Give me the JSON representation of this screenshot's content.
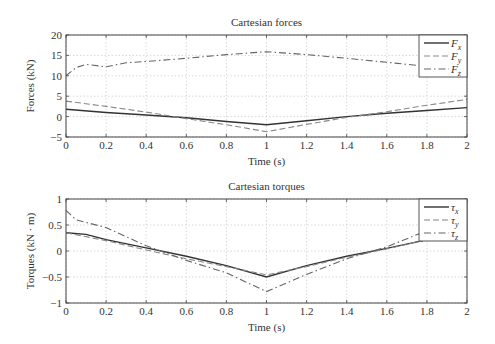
{
  "chart_data": [
    {
      "type": "line",
      "title": "Cartesian forces",
      "xlabel": "Time (s)",
      "ylabel": "Forces (kN)",
      "xlim": [
        0,
        2
      ],
      "ylim": [
        -5,
        20
      ],
      "xticks": [
        0,
        0.2,
        0.4,
        0.6,
        0.8,
        1,
        1.2,
        1.4,
        1.6,
        1.8,
        2
      ],
      "xtick_labels": [
        "0",
        "0.2",
        "0.4",
        "0.6",
        "0.8",
        "1",
        "1.2",
        "1.4",
        "1.6",
        "1.8",
        "2"
      ],
      "yticks": [
        -5,
        0,
        5,
        10,
        15,
        20
      ],
      "ytick_labels": [
        "−5",
        "0",
        "5",
        "10",
        "15",
        "20"
      ],
      "grid": true,
      "legend_position": "upper right",
      "series": [
        {
          "name": "Fx",
          "base": "F",
          "sub": "x",
          "style": "solid",
          "x": [
            0,
            0.2,
            0.4,
            0.6,
            0.8,
            1,
            1.2,
            1.4,
            1.6,
            1.8,
            2
          ],
          "values": [
            1.8,
            1.0,
            0.4,
            -0.3,
            -1.2,
            -2.0,
            -1.0,
            0.0,
            0.8,
            1.5,
            2.2
          ]
        },
        {
          "name": "Fy",
          "base": "F",
          "sub": "y",
          "style": "dashed",
          "x": [
            0,
            0.2,
            0.4,
            0.6,
            0.8,
            1,
            1.2,
            1.4,
            1.6,
            1.8,
            2
          ],
          "values": [
            3.8,
            2.5,
            1.1,
            -0.5,
            -2.0,
            -3.7,
            -1.9,
            -0.2,
            1.2,
            2.8,
            4.2
          ]
        },
        {
          "name": "Fz",
          "base": "F",
          "sub": "z",
          "style": "dashdot",
          "x": [
            0,
            0.05,
            0.1,
            0.2,
            0.3,
            0.4,
            0.6,
            0.8,
            1,
            1.2,
            1.4,
            1.6,
            1.78
          ],
          "values": [
            10.0,
            12.0,
            12.8,
            12.2,
            13.2,
            13.5,
            14.3,
            15.2,
            15.9,
            15.2,
            14.3,
            13.3,
            12.4
          ]
        }
      ]
    },
    {
      "type": "line",
      "title": "Cartesian torques",
      "xlabel": "Time (s)",
      "ylabel": "Torques (kN · m)",
      "xlim": [
        0,
        2
      ],
      "ylim": [
        -1,
        1
      ],
      "xticks": [
        0,
        0.2,
        0.4,
        0.6,
        0.8,
        1,
        1.2,
        1.4,
        1.6,
        1.8,
        2
      ],
      "xtick_labels": [
        "0",
        "0.2",
        "0.4",
        "0.6",
        "0.8",
        "1",
        "1.2",
        "1.4",
        "1.6",
        "1.8",
        "2"
      ],
      "yticks": [
        -1,
        -0.5,
        0,
        0.5,
        1
      ],
      "ytick_labels": [
        "−1",
        "−0.5",
        "0",
        "0.5",
        "1"
      ],
      "grid": true,
      "legend_position": "upper right",
      "series": [
        {
          "name": "τx",
          "base": "τ",
          "sub": "x",
          "style": "solid",
          "x": [
            0,
            0.1,
            0.2,
            0.4,
            0.6,
            0.8,
            1,
            1.2,
            1.4,
            1.6,
            1.78
          ],
          "values": [
            0.35,
            0.32,
            0.22,
            0.06,
            -0.1,
            -0.28,
            -0.5,
            -0.28,
            -0.1,
            0.05,
            0.2
          ]
        },
        {
          "name": "τy",
          "base": "τ",
          "sub": "y",
          "style": "dashed",
          "x": [
            0,
            0.2,
            0.4,
            0.6,
            0.8,
            1,
            1.2,
            1.4,
            1.6,
            1.78
          ],
          "values": [
            0.35,
            0.2,
            0.02,
            -0.15,
            -0.3,
            -0.46,
            -0.3,
            -0.12,
            0.04,
            0.2
          ]
        },
        {
          "name": "τz",
          "base": "τ",
          "sub": "z",
          "style": "dashdot",
          "x": [
            0,
            0.05,
            0.2,
            0.4,
            0.6,
            0.8,
            1,
            1.2,
            1.4,
            1.6,
            1.78
          ],
          "values": [
            0.78,
            0.6,
            0.45,
            0.1,
            -0.18,
            -0.42,
            -0.78,
            -0.45,
            -0.15,
            0.08,
            0.36
          ]
        }
      ]
    }
  ],
  "layout": {
    "panels": [
      {
        "left": 66,
        "right": 467,
        "top": 35,
        "bottom": 137
      },
      {
        "left": 66,
        "right": 467,
        "top": 199,
        "bottom": 303
      }
    ],
    "colors": {
      "axis": "#444444",
      "grid": "#cfcfcf",
      "line": "#333333",
      "line_light": "#888888"
    }
  }
}
